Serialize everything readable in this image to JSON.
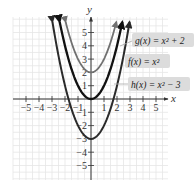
{
  "chart_data": {
    "type": "line",
    "title": "",
    "xlabel": "x",
    "ylabel": "y",
    "xlim": [
      -6,
      6
    ],
    "ylim": [
      -6,
      6
    ],
    "grid": true,
    "x_ticks": [
      -5,
      -4,
      -3,
      -2,
      -1,
      1,
      2,
      3,
      4,
      5
    ],
    "y_ticks": [
      -5,
      -4,
      -3,
      -2,
      -1,
      1,
      2,
      3,
      4,
      5
    ],
    "x_tick_labels": [
      "−5",
      "−4",
      "−3",
      "−2",
      "−1",
      "1",
      "2",
      "3",
      "4",
      "5"
    ],
    "y_tick_labels": [
      "−5",
      "−4",
      "−3",
      "−2",
      "−1",
      "1",
      "2",
      "3",
      "4",
      "5"
    ],
    "legend_position": "right, inside plot",
    "series": [
      {
        "name": "g(x) = x² + 2",
        "function": "x^2 + 2",
        "color": "#707070",
        "vertex": [
          0,
          2
        ],
        "x": [
          -2.0,
          -1.5,
          -1,
          -0.5,
          0,
          0.5,
          1,
          1.5,
          2.0
        ],
        "y": [
          6,
          4.25,
          3,
          2.25,
          2,
          2.25,
          3,
          4.25,
          6
        ]
      },
      {
        "name": "f(x) = x²",
        "function": "x^2",
        "color": "#111111",
        "vertex": [
          0,
          0
        ],
        "x": [
          -2.45,
          -2,
          -1,
          0,
          1,
          2,
          2.45
        ],
        "y": [
          6,
          4,
          1,
          0,
          1,
          4,
          6
        ]
      },
      {
        "name": "h(x) = x² − 3",
        "function": "x^2 - 3",
        "color": "#2a2a2a",
        "vertex": [
          0,
          -3
        ],
        "x": [
          -3,
          -2,
          -1,
          0,
          1,
          2,
          3
        ],
        "y": [
          6,
          1,
          -2,
          -3,
          -2,
          1,
          6
        ]
      }
    ]
  },
  "labels": {
    "x_axis": "x",
    "y_axis": "y",
    "legend_g": "g(x) = x² + 2",
    "legend_f": "f(x) = x²",
    "legend_h": "h(x) = x² − 3"
  },
  "ticks": {
    "x": [
      "−5",
      "−4",
      "−3",
      "−2",
      "−1",
      "1",
      "2",
      "3",
      "4",
      "5"
    ],
    "y": [
      "5",
      "4",
      "3",
      "2",
      "1",
      "−1",
      "−2",
      "−3",
      "−4",
      "−5"
    ]
  },
  "colors": {
    "grid": "#e6e6e6",
    "axis": "#333333",
    "g": "#707070",
    "f": "#111111",
    "h": "#2a2a2a",
    "legend_bg": "#dcdcdc"
  }
}
